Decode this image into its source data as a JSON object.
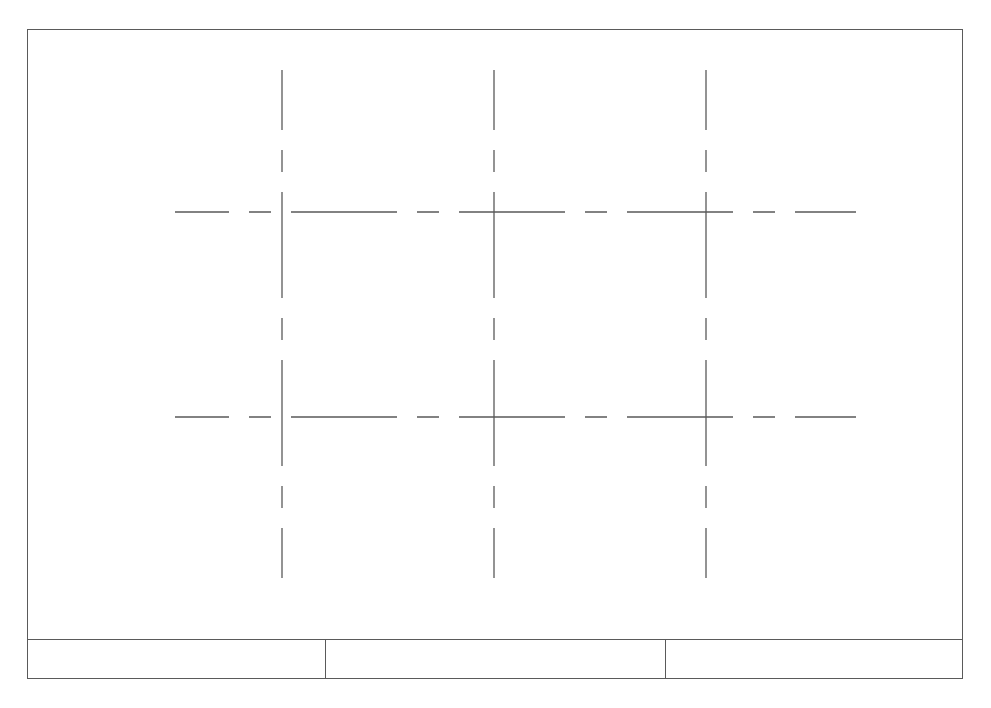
{
  "drawing": {
    "type": "technical-drawing-centerline-grid",
    "frame": {
      "x": 27,
      "y": 29,
      "width": 936,
      "height": 650
    },
    "line_color": "#5a5a5a",
    "centerline_pattern": {
      "long_dash_px": 106,
      "short_dash_px": 22,
      "gap_px": 20
    },
    "vertical_centerlines": [
      {
        "x": 282,
        "y_start": 70,
        "y_end": 578
      },
      {
        "x": 494,
        "y_start": 70,
        "y_end": 578
      },
      {
        "x": 706,
        "y_start": 70,
        "y_end": 578
      }
    ],
    "horizontal_centerlines": [
      {
        "y": 212,
        "x_start": 175,
        "x_end": 856
      },
      {
        "y": 417,
        "x_start": 175,
        "x_end": 856
      }
    ],
    "intersections": [
      {
        "x": 282,
        "y": 212
      },
      {
        "x": 494,
        "y": 212
      },
      {
        "x": 706,
        "y": 212
      },
      {
        "x": 282,
        "y": 417
      },
      {
        "x": 494,
        "y": 417
      },
      {
        "x": 706,
        "y": 417
      }
    ]
  },
  "title_block": {
    "cells": [
      {
        "label": "",
        "width": 298
      },
      {
        "label": "",
        "width": 340
      },
      {
        "label": "",
        "width": 298
      }
    ]
  }
}
